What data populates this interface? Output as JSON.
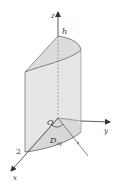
{
  "figure": {
    "labels": {
      "z_axis": "z",
      "y_axis": "y",
      "x_axis": "x",
      "height": "h",
      "origin": "O",
      "radius": "2",
      "region_main": "D",
      "region_sub": "xy"
    },
    "colors": {
      "fill": "#e6e6e6",
      "stroke": "#555555",
      "axis": "#333333",
      "background": "#ffffff"
    }
  }
}
